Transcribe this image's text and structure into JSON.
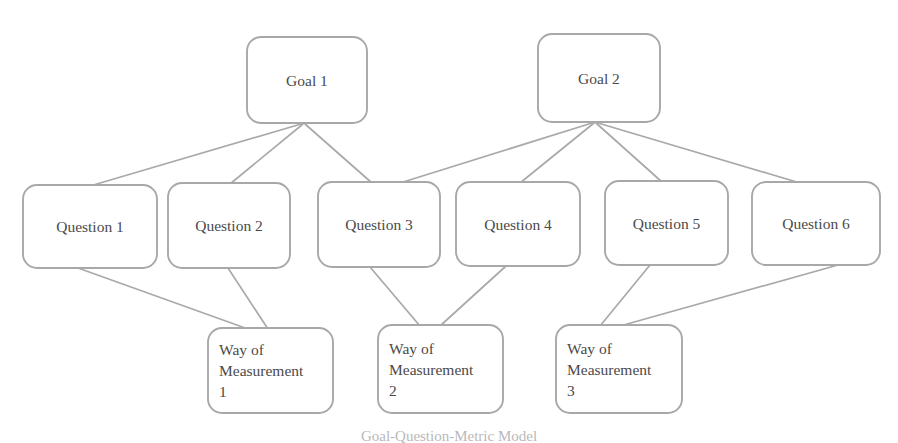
{
  "diagram": {
    "caption": "Goal-Question-Metric Model",
    "colors": {
      "background": "#ffffff",
      "node_border": "#a8a8a8",
      "node_fill": "#ffffff",
      "edge": "#a9a9a9",
      "text": "#4a4a4a",
      "caption": "#b9b9b9"
    },
    "levels": {
      "goals_label": "Goal",
      "questions_label": "Question",
      "measurements_label": "Way of Measurement"
    },
    "goals": [
      {
        "id": "goal1",
        "label": "Goal 1",
        "x": 247,
        "y": 37,
        "w": 120,
        "h": 86
      },
      {
        "id": "goal2",
        "label": "Goal 2",
        "x": 538,
        "y": 34,
        "w": 122,
        "h": 88
      }
    ],
    "questions": [
      {
        "id": "q1",
        "label": "Question 1",
        "x": 23,
        "y": 185,
        "w": 134,
        "h": 83
      },
      {
        "id": "q2",
        "label": "Question 2",
        "x": 168,
        "y": 183,
        "w": 122,
        "h": 85
      },
      {
        "id": "q3",
        "label": "Question 3",
        "x": 318,
        "y": 182,
        "w": 122,
        "h": 85
      },
      {
        "id": "q4",
        "label": "Question 4",
        "x": 456,
        "y": 182,
        "w": 124,
        "h": 84
      },
      {
        "id": "q5",
        "label": "Question 5",
        "x": 605,
        "y": 181,
        "w": 123,
        "h": 84
      },
      {
        "id": "q6",
        "label": "Question 6",
        "x": 752,
        "y": 182,
        "w": 128,
        "h": 83
      }
    ],
    "measurements": [
      {
        "id": "wom1",
        "lines": [
          "Way of",
          "Measurement",
          "1"
        ],
        "x": 208,
        "y": 328,
        "w": 125,
        "h": 85
      },
      {
        "id": "wom2",
        "lines": [
          "Way of",
          "Measurement",
          "2"
        ],
        "x": 378,
        "y": 325,
        "w": 125,
        "h": 88
      },
      {
        "id": "wom3",
        "lines": [
          "Way of",
          "Measurement",
          "3"
        ],
        "x": 556,
        "y": 325,
        "w": 126,
        "h": 88
      }
    ],
    "edges": [
      {
        "id": "e-g1-q1",
        "from": "goal1",
        "to": "q1",
        "x1": 301,
        "y1": 124,
        "x2": 90,
        "y2": 186
      },
      {
        "id": "e-g1-q2",
        "from": "goal1",
        "to": "q2",
        "x1": 303,
        "y1": 124,
        "x2": 230,
        "y2": 184
      },
      {
        "id": "e-g1-q3",
        "from": "goal1",
        "to": "q3",
        "x1": 305,
        "y1": 124,
        "x2": 372,
        "y2": 183
      },
      {
        "id": "e-g2-q3",
        "from": "goal2",
        "to": "q3",
        "x1": 592,
        "y1": 123,
        "x2": 400,
        "y2": 183
      },
      {
        "id": "e-g2-q4",
        "from": "goal2",
        "to": "q4",
        "x1": 594,
        "y1": 123,
        "x2": 520,
        "y2": 183
      },
      {
        "id": "e-g2-q5",
        "from": "goal2",
        "to": "q5",
        "x1": 596,
        "y1": 123,
        "x2": 662,
        "y2": 182
      },
      {
        "id": "e-g2-q6",
        "from": "goal2",
        "to": "q6",
        "x1": 598,
        "y1": 123,
        "x2": 800,
        "y2": 183
      },
      {
        "id": "e-q1-w1",
        "from": "q1",
        "to": "wom1",
        "x1": 78,
        "y1": 268,
        "x2": 248,
        "y2": 329
      },
      {
        "id": "e-q2-w1",
        "from": "q2",
        "to": "wom1",
        "x1": 228,
        "y1": 268,
        "x2": 268,
        "y2": 329
      },
      {
        "id": "e-q3-w2",
        "from": "q3",
        "to": "wom2",
        "x1": 370,
        "y1": 267,
        "x2": 420,
        "y2": 326
      },
      {
        "id": "e-q4-w2",
        "from": "q4",
        "to": "wom2",
        "x1": 506,
        "y1": 266,
        "x2": 440,
        "y2": 326
      },
      {
        "id": "e-q5-w3",
        "from": "q5",
        "to": "wom3",
        "x1": 650,
        "y1": 265,
        "x2": 600,
        "y2": 326
      },
      {
        "id": "e-q6-w3",
        "from": "q6",
        "to": "wom3",
        "x1": 838,
        "y1": 265,
        "x2": 620,
        "y2": 326
      }
    ]
  }
}
